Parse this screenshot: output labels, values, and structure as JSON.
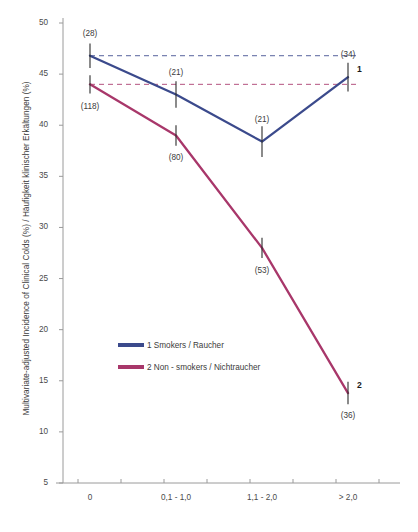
{
  "chart_data": {
    "type": "line",
    "title": "",
    "xlabel": "",
    "ylabel": "Multivariate-adjusted Incidence of Clinical Colds (%) / Häufigkeit klinischer Erkältungen (%)",
    "categories": [
      "0",
      "0,1 - 1,0",
      "1,1 - 2,0",
      "> 2,0"
    ],
    "ylim": [
      5,
      50
    ],
    "yticks": [
      50,
      45,
      40,
      35,
      30,
      25,
      20,
      15,
      10,
      5
    ],
    "grid": false,
    "legend_position": "inside-lower-left",
    "series": [
      {
        "name": "1 Smokers / Raucher",
        "color": "#3b4a8c",
        "end_label": "1",
        "values": [
          46.8,
          43.0,
          38.4,
          44.7
        ],
        "counts": [
          "(28)",
          "(21)",
          "(21)",
          "(34)"
        ],
        "errors": [
          1.2,
          1.3,
          1.5,
          1.4
        ]
      },
      {
        "name": "2 Non - smokers / Nichtraucher",
        "color": "#a8376a",
        "end_label": "2",
        "values": [
          44.0,
          39.0,
          28.0,
          13.8
        ],
        "counts": [
          "(118)",
          "(80)",
          "(53)",
          "(36)"
        ],
        "errors": [
          0.9,
          1.0,
          1.0,
          1.1
        ]
      }
    ],
    "reference_lines": [
      {
        "value": 46.8,
        "color": "#3b4a8c",
        "style": "dashed"
      },
      {
        "value": 44.0,
        "color": "#a8376a",
        "style": "dashed"
      }
    ],
    "annotations": {
      "count_positions": [
        {
          "text": "(28)",
          "series": 0,
          "index": 0,
          "placement": "above"
        },
        {
          "text": "(21)",
          "series": 0,
          "index": 1,
          "placement": "above"
        },
        {
          "text": "(21)",
          "series": 0,
          "index": 2,
          "placement": "above"
        },
        {
          "text": "(34)",
          "series": 0,
          "index": 3,
          "placement": "above"
        },
        {
          "text": "(118)",
          "series": 1,
          "index": 0,
          "placement": "below"
        },
        {
          "text": "(80)",
          "series": 1,
          "index": 1,
          "placement": "below"
        },
        {
          "text": "(53)",
          "series": 1,
          "index": 2,
          "placement": "below"
        },
        {
          "text": "(36)",
          "series": 1,
          "index": 3,
          "placement": "below"
        }
      ]
    },
    "axis_color": "#9a9a9a",
    "background": "#ffffff"
  },
  "caption": {
    "text": ""
  }
}
